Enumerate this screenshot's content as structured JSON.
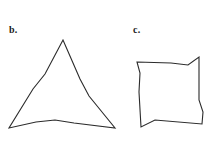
{
  "figure": {
    "background_color": "#ffffff",
    "stroke_color": "#2b2b2b",
    "text_color": "#1a1a1a",
    "width": 212,
    "height": 145,
    "panels": [
      {
        "id": "b",
        "label": "b.",
        "label_x": 9,
        "label_y": 25,
        "shape_name": "concave-triangle",
        "closed": true,
        "points": "63,40 45,74 33,89 9,128 36,122 55,120 74,123 115,128 89,96 80,79"
      },
      {
        "id": "c",
        "label": "c.",
        "label_x": 133,
        "label_y": 25,
        "shape_name": "concave-quadrilateral",
        "closed": true,
        "points": "137,62 171,63 188,65 199,57 199,100 203,112 202,124 155,120 141,127 139,92 140,73"
      }
    ]
  }
}
